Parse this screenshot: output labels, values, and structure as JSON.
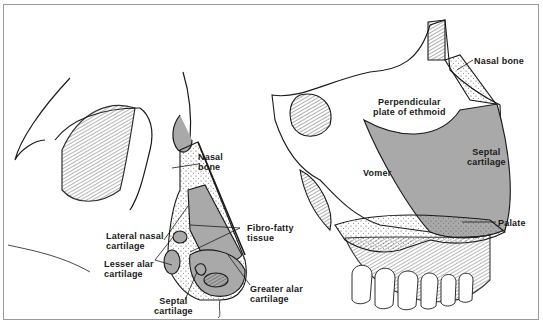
{
  "figure": {
    "left_panel": {
      "title": "Lateral view of external nose",
      "labels": {
        "nasal_bone": [
          "Nasal",
          "bone"
        ],
        "fibro_fatty_tissue": [
          "Fibro-fatty",
          "tissue"
        ],
        "lateral_nasal_cartilage": [
          "Lateral nasal",
          "cartilage"
        ],
        "lesser_alar_cartilage": [
          "Lesser alar",
          "cartilage"
        ],
        "septal_cartilage": [
          "Septal",
          "cartilage"
        ],
        "greater_alar_cartilage": [
          "Greater alar",
          "cartilage"
        ]
      }
    },
    "right_panel": {
      "title": "Nasal septum",
      "labels": {
        "nasal_bone": "Nasal bone",
        "perpendicular_plate": [
          "Perpendicular",
          "plate of ethmoid"
        ],
        "septal_cartilage": [
          "Septal",
          "cartilage"
        ],
        "vomer": "Vomer",
        "palate": "Palate"
      }
    },
    "colors": {
      "cartilage_fill": "#a9a9a9",
      "line": "#1a1a1a",
      "background": "#ffffff",
      "border": "#9a9a9a"
    }
  }
}
